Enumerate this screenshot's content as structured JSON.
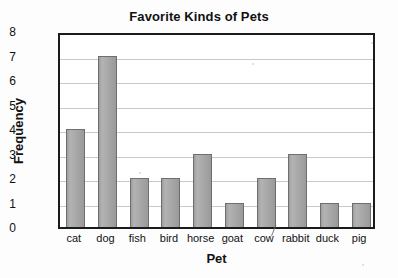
{
  "chart_data": {
    "type": "bar",
    "title": "Favorite Kinds of Pets",
    "xlabel": "Pet",
    "ylabel": "Frequency",
    "categories": [
      "cat",
      "dog",
      "fish",
      "bird",
      "horse",
      "goat",
      "cow",
      "rabbit",
      "duck",
      "pig"
    ],
    "values": [
      4,
      7,
      2,
      2,
      3,
      1,
      2,
      3,
      1,
      1
    ],
    "ylim": [
      0,
      8
    ],
    "ytick_labels": [
      "8",
      "7",
      "6",
      "5",
      "4",
      "3",
      "2",
      "1",
      "0"
    ],
    "ytick_values": [
      8,
      7,
      6,
      5,
      4,
      3,
      2,
      1,
      0
    ],
    "grid": "horizontal",
    "legend": "none",
    "bar_fill_color": "#a9a9a9",
    "bar_edge_color": "#6e6e6e",
    "gridline_color": "#c9c9c9",
    "frame_color": "#1b1b1b",
    "background_color": "#ffffff",
    "annotations": [
      "stray pencil mark above the word cow"
    ]
  }
}
